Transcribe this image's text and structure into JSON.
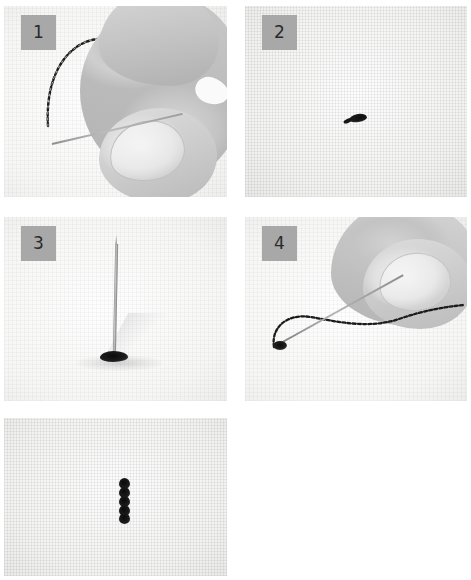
{
  "document": {
    "title": "Hand sewing stitch tutorial",
    "kind": "instructional photo sequence",
    "background_color": "#ffffff",
    "badge_color": "#a8a8a8",
    "badge_text_color": "#2a2a2a",
    "panel_count": 5
  },
  "panels": [
    {
      "id": "panel-1",
      "badge": "1",
      "has_badge": true,
      "caption": "Hand holding needle with knotted thread above fabric",
      "subjects": [
        "hand",
        "thumb",
        "fingernail",
        "needle",
        "thread",
        "fabric"
      ]
    },
    {
      "id": "panel-2",
      "badge": "2",
      "has_badge": true,
      "caption": "Small black knot resting on woven white fabric",
      "subjects": [
        "fabric",
        "knot"
      ]
    },
    {
      "id": "panel-3",
      "badge": "3",
      "has_badge": true,
      "caption": "Needle standing upright through the fabric at the knot",
      "subjects": [
        "needle",
        "knot",
        "fabric",
        "shadow"
      ]
    },
    {
      "id": "panel-4",
      "badge": "4",
      "has_badge": true,
      "caption": "Hand pulling the needle and thread across the fabric",
      "subjects": [
        "hand",
        "thumb",
        "fingernail",
        "needle",
        "thread",
        "fabric"
      ]
    },
    {
      "id": "panel-5",
      "badge": "",
      "has_badge": false,
      "caption": "Finished vertical twisted stitch on the fabric",
      "subjects": [
        "fabric",
        "stitch"
      ]
    }
  ]
}
